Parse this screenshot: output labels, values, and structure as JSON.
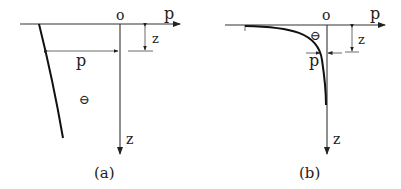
{
  "panels": [
    {
      "id": "a",
      "caption": "(a)",
      "origin_label": "o",
      "horizontal_axis_label": "p",
      "vertical_axis_label": "z",
      "pressure_label": "p",
      "depth_label": "z",
      "sign_symbol": "⊖",
      "description": "Linear-like pressure distribution increasing slowly with depth"
    },
    {
      "id": "b",
      "caption": "(b)",
      "origin_label": "o",
      "horizontal_axis_label": "p",
      "vertical_axis_label": "z",
      "pressure_label": "p",
      "depth_label": "z",
      "sign_symbol": "⊖",
      "description": "Pressure distribution decaying rapidly with depth"
    }
  ]
}
